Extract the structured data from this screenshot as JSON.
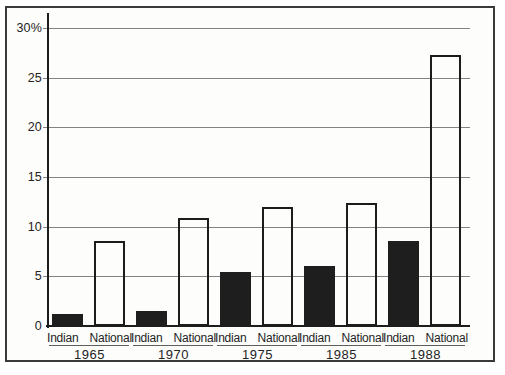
{
  "figure": {
    "background_color": "#fdfdfb",
    "frame_border_color": "#3a3a3a",
    "gridline_color": "#838383",
    "axis_color": "#1d1d1d"
  },
  "chart_data": {
    "type": "bar",
    "title": "",
    "xlabel": "",
    "ylabel": "",
    "categories": [
      "1965",
      "1970",
      "1975",
      "1985",
      "1988"
    ],
    "series": [
      {
        "name": "Indian",
        "style": "solid",
        "color": "#1e1e1e",
        "values": [
          1.2,
          1.5,
          5.4,
          6.0,
          8.6
        ]
      },
      {
        "name": "National",
        "style": "outline",
        "color": "#ffffff",
        "values": [
          8.6,
          10.9,
          12.0,
          12.4,
          27.3
        ]
      }
    ],
    "ylim": [
      0,
      30
    ],
    "yticks": [
      0,
      5,
      10,
      15,
      20,
      25,
      30
    ],
    "ytick_labels": [
      "0",
      "5",
      "10",
      "15",
      "20",
      "25",
      "30%"
    ],
    "grid": true,
    "legend_position": "none",
    "group_label_underlined": true
  }
}
